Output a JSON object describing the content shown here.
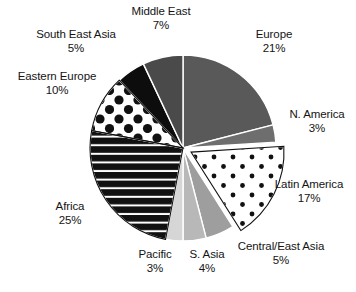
{
  "chart_data": {
    "type": "pie",
    "title": "",
    "subtitle": "",
    "xlabel": "",
    "ylabel": "",
    "legend_position": "none",
    "labels_inline": true,
    "units": "%",
    "total": 100,
    "categories": [
      "Europe",
      "N. America",
      "Latin America",
      "Central/East Asia",
      "S. Asia",
      "Pacific",
      "Africa",
      "Eastern Europe",
      "South East Asia",
      "Middle East"
    ],
    "values": [
      21,
      3,
      17,
      5,
      4,
      3,
      25,
      10,
      5,
      7
    ],
    "slices": [
      {
        "name": "Europe",
        "value": 21,
        "value_label": "21%",
        "fill_style": "solid",
        "color": "#595959",
        "start_angle": 0,
        "end_angle": 75.6,
        "exploded": false
      },
      {
        "name": "N. America",
        "value": 3,
        "value_label": "3%",
        "fill_style": "solid",
        "color": "#6e6e6e",
        "start_angle": 75.6,
        "end_angle": 86.4,
        "exploded": false
      },
      {
        "name": "Latin America",
        "value": 17,
        "value_label": "17%",
        "fill_style": "dots-small",
        "color": "#ffffff",
        "pattern_color": "#111111",
        "start_angle": 86.4,
        "end_angle": 147.6,
        "exploded": true
      },
      {
        "name": "Central/East Asia",
        "value": 5,
        "value_label": "5%",
        "fill_style": "solid",
        "color": "#9e9e9e",
        "start_angle": 147.6,
        "end_angle": 165.6,
        "exploded": false
      },
      {
        "name": "S. Asia",
        "value": 4,
        "value_label": "4%",
        "fill_style": "solid",
        "color": "#b8b8b8",
        "start_angle": 165.6,
        "end_angle": 180.0,
        "exploded": false
      },
      {
        "name": "Pacific",
        "value": 3,
        "value_label": "3%",
        "fill_style": "solid",
        "color": "#d6d6d6",
        "start_angle": 180.0,
        "end_angle": 190.8,
        "exploded": false
      },
      {
        "name": "Africa",
        "value": 25,
        "value_label": "25%",
        "fill_style": "horizontal-stripes",
        "color": "#111111",
        "pattern_color": "#ffffff",
        "start_angle": 190.8,
        "end_angle": 280.8,
        "exploded": false
      },
      {
        "name": "Eastern Europe",
        "value": 10,
        "value_label": "10%",
        "fill_style": "dots-large",
        "color": "#ffffff",
        "pattern_color": "#111111",
        "start_angle": 280.8,
        "end_angle": 316.8,
        "exploded": false
      },
      {
        "name": "South East Asia",
        "value": 5,
        "value_label": "5%",
        "fill_style": "solid",
        "color": "#0d0d0d",
        "start_angle": 316.8,
        "end_angle": 334.8,
        "exploded": false
      },
      {
        "name": "Middle East",
        "value": 7,
        "value_label": "7%",
        "fill_style": "solid",
        "color": "#4a4a4a",
        "start_angle": 334.8,
        "end_angle": 360.0,
        "exploded": false
      }
    ]
  },
  "labels": {
    "europe": {
      "name": "Europe",
      "value": "21%"
    },
    "n_america": {
      "name": "N. America",
      "value": "3%"
    },
    "latin_america": {
      "name": "Latin America",
      "value": "17%"
    },
    "central_east_asia": {
      "name": "Central/East Asia",
      "value": "5%"
    },
    "s_asia": {
      "name": "S. Asia",
      "value": "4%"
    },
    "pacific": {
      "name": "Pacific",
      "value": "3%"
    },
    "africa": {
      "name": "Africa",
      "value": "25%"
    },
    "eastern_europe": {
      "name": "Eastern Europe",
      "value": "10%"
    },
    "south_east_asia": {
      "name": "South East Asia",
      "value": "5%"
    },
    "middle_east": {
      "name": "Middle East",
      "value": "7%"
    }
  }
}
